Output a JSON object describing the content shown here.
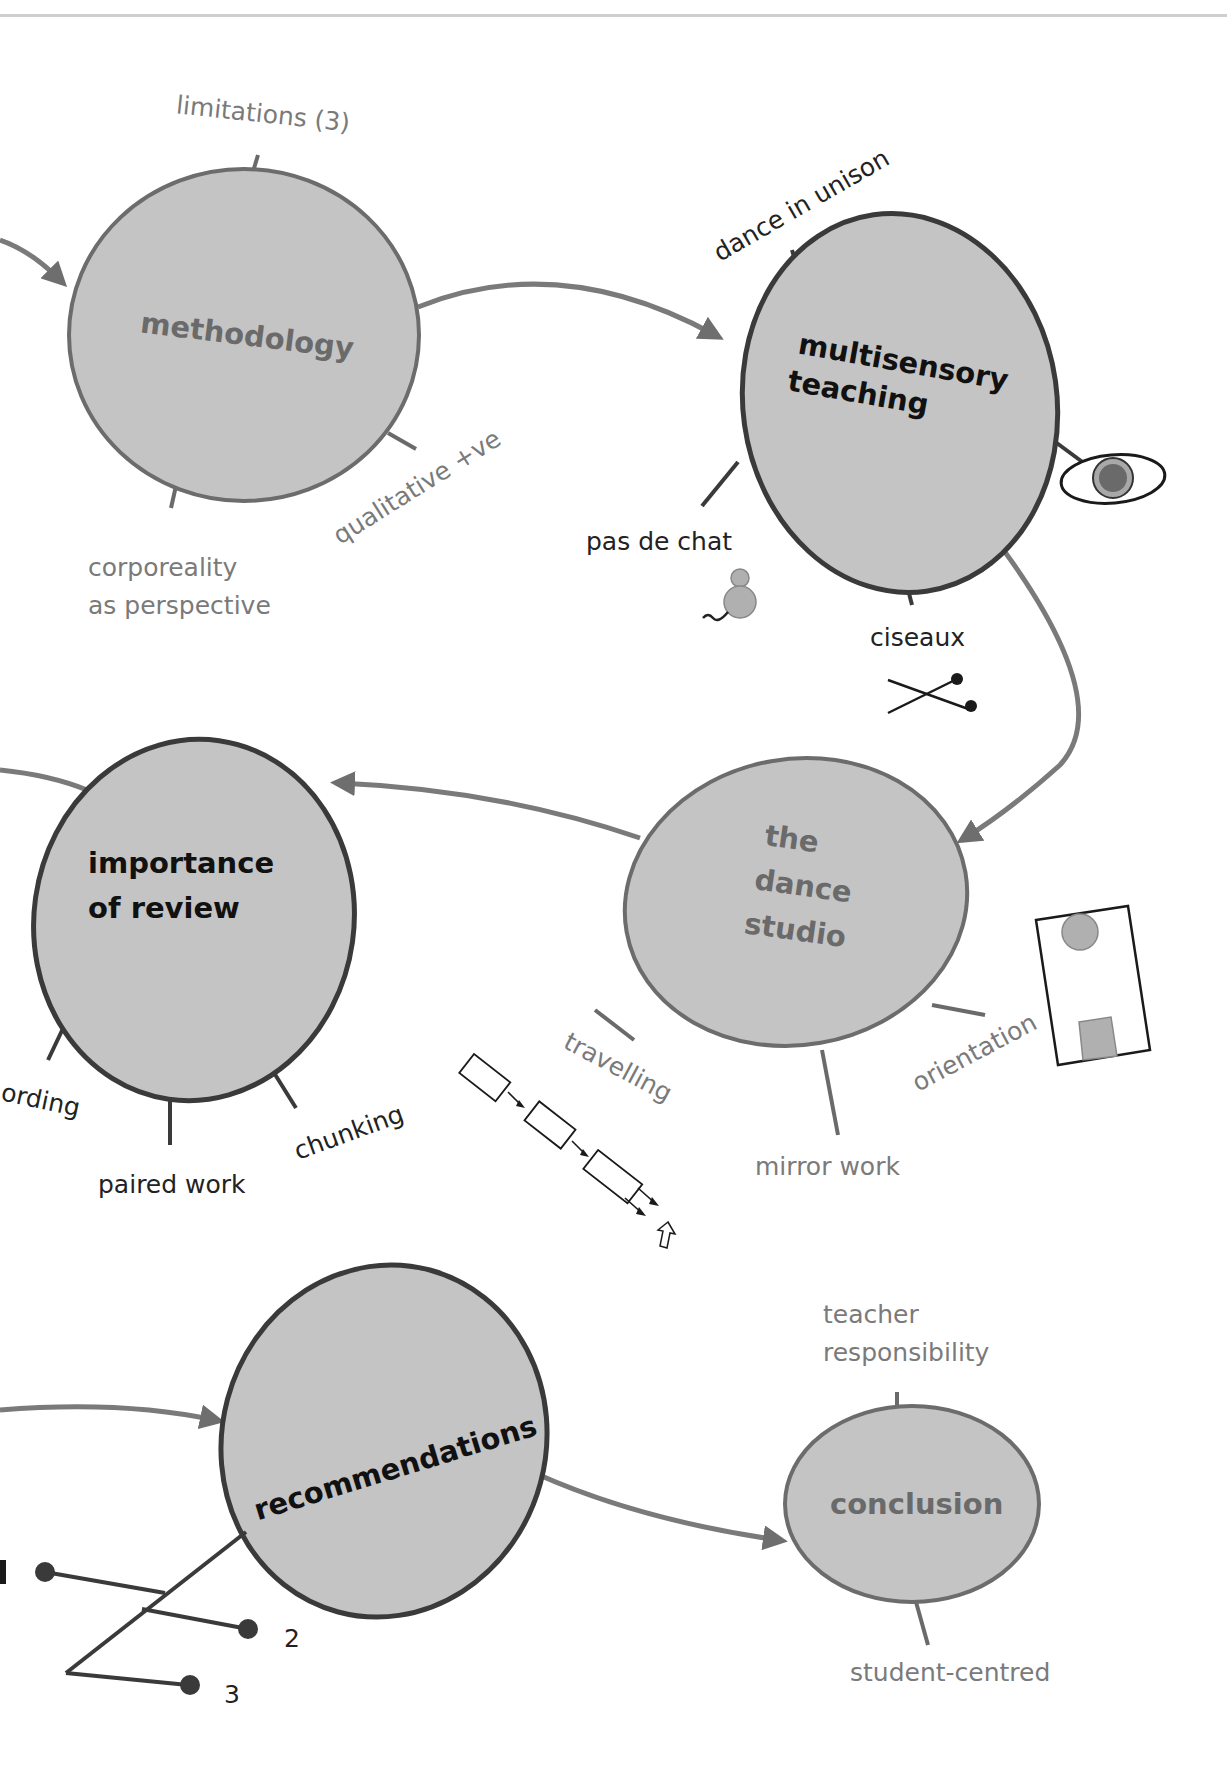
{
  "colors": {
    "node_fill": "#c4c4c4",
    "node_border_light": "#6c6c6c",
    "node_border_dark": "#3a3a3a",
    "connector": "#7a7a7a",
    "label_grey": "#7a7a7a",
    "label_dark": "#222222",
    "icon_fill_grey": "#a8a8a8",
    "icon_fill_dark": "#555555"
  },
  "nodes": {
    "methodology": {
      "title": "methodology",
      "branches": [
        "limitations (3)",
        "qualitative +ve",
        "corporeality",
        "as perspective"
      ]
    },
    "multisensory": {
      "title_line1": "multisensory",
      "title_line2": "teaching",
      "branches": [
        "dance in unison",
        "pas de chat",
        "ciseaux"
      ],
      "icons": [
        "eye-icon",
        "mouse-icon",
        "scissors-icon"
      ]
    },
    "importance_of_review": {
      "title_line1": "importance",
      "title_line2": "of review",
      "branches": [
        "ording",
        "paired work",
        "chunking"
      ]
    },
    "dance_studio": {
      "title_line1": "the",
      "title_line2": "dance",
      "title_line3": "studio",
      "branches": [
        "travelling",
        "mirror work",
        "orientation"
      ],
      "icons": [
        "travelling-path-icon",
        "studio-orientation-icon"
      ]
    },
    "recommendations": {
      "title": "recommendations",
      "list_items": [
        "2",
        "3"
      ]
    },
    "conclusion": {
      "title": "conclusion",
      "branches": [
        "teacher",
        "responsibility",
        "student-centred"
      ]
    }
  }
}
